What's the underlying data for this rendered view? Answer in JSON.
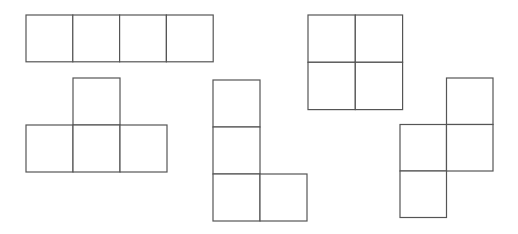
{
  "diagram": {
    "title": "",
    "line_color": "#555555",
    "background": "#ffffff",
    "shapes": [
      {
        "id": "tetromino-i",
        "kind": "I",
        "cells": [
          [
            0,
            0
          ],
          [
            1,
            0
          ],
          [
            2,
            0
          ],
          [
            3,
            0
          ]
        ]
      },
      {
        "id": "tetromino-t",
        "kind": "T",
        "cells": [
          [
            1,
            0
          ],
          [
            0,
            1
          ],
          [
            1,
            1
          ],
          [
            2,
            1
          ]
        ]
      },
      {
        "id": "tetromino-l",
        "kind": "L",
        "cells": [
          [
            0,
            0
          ],
          [
            0,
            1
          ],
          [
            0,
            2
          ],
          [
            1,
            2
          ]
        ]
      },
      {
        "id": "tetromino-o",
        "kind": "O",
        "cells": [
          [
            0,
            0
          ],
          [
            1,
            0
          ],
          [
            0,
            1
          ],
          [
            1,
            1
          ]
        ]
      },
      {
        "id": "tetromino-s",
        "kind": "S",
        "cells": [
          [
            1,
            0
          ],
          [
            0,
            1
          ],
          [
            1,
            1
          ],
          [
            0,
            2
          ]
        ]
      }
    ]
  }
}
